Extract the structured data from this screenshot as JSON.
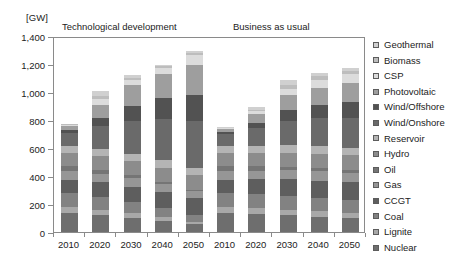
{
  "chart_data": {
    "type": "bar",
    "subtype": "stacked-bar",
    "title": "",
    "unit_label": "[GW]",
    "xlabel": "",
    "ylabel": "",
    "ylim": [
      0,
      1400
    ],
    "yticks": [
      0,
      200,
      400,
      600,
      800,
      1000,
      1200,
      1400
    ],
    "ytick_labels": [
      "0",
      "200",
      "400",
      "600",
      "800",
      "1,000",
      "1,200",
      "1,400"
    ],
    "grid": false,
    "legend_position": "right",
    "panels": [
      {
        "name": "tech",
        "label": "Technological development",
        "categories": [
          "2010",
          "2020",
          "2030",
          "2040",
          "2050"
        ]
      },
      {
        "name": "bau",
        "label": "Business as usual",
        "categories": [
          "2010",
          "2020",
          "2030",
          "2040",
          "2050"
        ]
      }
    ],
    "categories": [
      "2010",
      "2020",
      "2030",
      "2040",
      "2050",
      "2010",
      "2020",
      "2030",
      "2040",
      "2050"
    ],
    "totals": [
      875,
      1005,
      1120,
      1195,
      1295,
      830,
      945,
      1085,
      1135,
      1170
    ],
    "series": [
      {
        "name": "Nuclear",
        "color": "#6e6e6e",
        "values": [
          135,
          120,
          100,
          80,
          55,
          135,
          130,
          120,
          110,
          100
        ]
      },
      {
        "name": "Lignite",
        "color": "#a8a8a8",
        "values": [
          45,
          40,
          35,
          28,
          20,
          45,
          42,
          40,
          38,
          35
        ]
      },
      {
        "name": "Coal",
        "color": "#828282",
        "values": [
          100,
          90,
          78,
          62,
          45,
          100,
          100,
          98,
          95,
          92
        ]
      },
      {
        "name": "CCGT",
        "color": "#5e5e5e",
        "values": [
          95,
          105,
          112,
          118,
          120,
          95,
          105,
          118,
          125,
          130
        ]
      },
      {
        "name": "Gas",
        "color": "#969696",
        "values": [
          60,
          62,
          60,
          55,
          50,
          60,
          62,
          65,
          66,
          68
        ]
      },
      {
        "name": "Oil",
        "color": "#757575",
        "values": [
          35,
          28,
          22,
          16,
          10,
          35,
          30,
          26,
          22,
          18
        ]
      },
      {
        "name": "Hydro",
        "color": "#8c8c8c",
        "values": [
          95,
          98,
          100,
          102,
          105,
          95,
          98,
          100,
          102,
          104
        ]
      },
      {
        "name": "Reservoir",
        "color": "#b4b4b4",
        "values": [
          48,
          50,
          52,
          54,
          56,
          48,
          50,
          52,
          54,
          55
        ]
      },
      {
        "name": "Wind/Onshore",
        "color": "#6a6a6a",
        "values": [
          95,
          165,
          235,
          290,
          330,
          85,
          125,
          175,
          200,
          215
        ]
      },
      {
        "name": "Wind/Offshore",
        "color": "#525252",
        "values": [
          20,
          55,
          110,
          150,
          185,
          15,
          40,
          75,
          95,
          110
        ]
      },
      {
        "name": "Photovoltaic",
        "color": "#9e9e9e",
        "values": [
          30,
          95,
          150,
          175,
          215,
          25,
          60,
          110,
          125,
          140
        ]
      },
      {
        "name": "CSP",
        "color": "#dcdcdc",
        "values": [
          5,
          40,
          35,
          45,
          75,
          3,
          20,
          42,
          55,
          65
        ]
      },
      {
        "name": "Biomass",
        "color": "#bdbdbd",
        "values": [
          7,
          22,
          12,
          10,
          14,
          4,
          12,
          28,
          30,
          22
        ]
      },
      {
        "name": "Geothermal",
        "color": "#d0d0d0",
        "values": [
          5,
          35,
          19,
          10,
          15,
          5,
          21,
          36,
          18,
          16
        ]
      }
    ],
    "legend_entries": [
      {
        "label": "Geothermal",
        "color": "#d0d0d0"
      },
      {
        "label": "Biomass",
        "color": "#bdbdbd"
      },
      {
        "label": "CSP",
        "color": "#dcdcdc"
      },
      {
        "label": "Photovoltaic",
        "color": "#9e9e9e"
      },
      {
        "label": "Wind/Offshore",
        "color": "#525252"
      },
      {
        "label": "Wind/Onshore",
        "color": "#6a6a6a"
      },
      {
        "label": "Reservoir",
        "color": "#b4b4b4"
      },
      {
        "label": "Hydro",
        "color": "#8c8c8c"
      },
      {
        "label": "Oil",
        "color": "#757575"
      },
      {
        "label": "Gas",
        "color": "#969696"
      },
      {
        "label": "CCGT",
        "color": "#5e5e5e"
      },
      {
        "label": "Coal",
        "color": "#828282"
      },
      {
        "label": "Lignite",
        "color": "#a8a8a8"
      },
      {
        "label": "Nuclear",
        "color": "#6e6e6e"
      }
    ]
  }
}
